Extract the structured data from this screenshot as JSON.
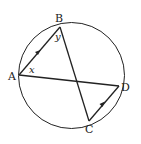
{
  "diagram": {
    "type": "circle-geometry",
    "circle": {
      "cx": 71.5,
      "cy": 75.5,
      "r": 53
    },
    "points": {
      "A": {
        "label": "A",
        "x": 19,
        "y": 75
      },
      "B": {
        "label": "B",
        "x": 60,
        "y": 27
      },
      "C": {
        "label": "C",
        "x": 89,
        "y": 121
      },
      "D": {
        "label": "D",
        "x": 119,
        "y": 86
      }
    },
    "segments": [
      "AB",
      "BC",
      "AD",
      "CD"
    ],
    "parallel_marks": [
      "AB",
      "CD"
    ],
    "angles": {
      "x": {
        "label": "x",
        "at": "A"
      },
      "y": {
        "label": "y",
        "at": "B"
      }
    },
    "colors": {
      "stroke": "#222222",
      "background": "#ffffff"
    }
  }
}
